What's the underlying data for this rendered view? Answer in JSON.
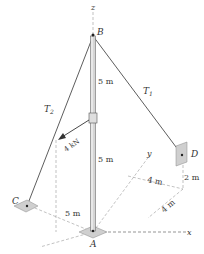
{
  "figure": {
    "points": {
      "A": "A",
      "B": "B",
      "C": "C",
      "D": "D"
    },
    "axes": {
      "x": "x",
      "y": "y",
      "z": "z"
    },
    "tensions": {
      "t1": "T",
      "t1_sub": "1",
      "t2": "T",
      "t2_sub": "2"
    },
    "force": {
      "label": "4 kN"
    },
    "dimensions": {
      "upper_pole": "5 m",
      "lower_pole": "5 m",
      "c_offset": "5 m",
      "d_y_offset": "4 m",
      "d_x_offset": "4 m",
      "d_height": "2 m"
    },
    "colors": {
      "line": "#333333",
      "plate": "#d0d0d0",
      "pole": "#e6e6e6",
      "dashed": "#888888"
    }
  }
}
